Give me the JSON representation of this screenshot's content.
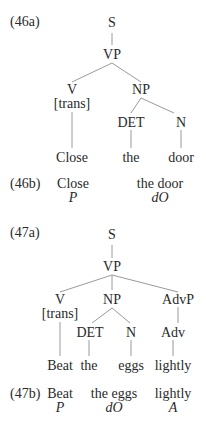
{
  "examples": [
    {
      "tree_label": "(46a)",
      "nodes": {
        "s": "S",
        "vp": "VP",
        "v": "V",
        "v_feature": "[trans]",
        "np": "NP",
        "det": "DET",
        "n": "N"
      },
      "leaves": {
        "verb": "Close",
        "det": "the",
        "noun": "door"
      },
      "gloss_label": "(46b)",
      "gloss": [
        {
          "text": "Close",
          "role": "P"
        },
        {
          "text": "the door",
          "role": "dO"
        }
      ]
    },
    {
      "tree_label": "(47a)",
      "nodes": {
        "s": "S",
        "vp": "VP",
        "v": "V",
        "v_feature": "[trans]",
        "np": "NP",
        "advp": "AdvP",
        "det": "DET",
        "n": "N",
        "adv": "Adv"
      },
      "leaves": {
        "verb": "Beat",
        "det": "the",
        "noun": "eggs",
        "adv": "lightly"
      },
      "gloss_label": "(47b)",
      "gloss": [
        {
          "text": "Beat",
          "role": "P"
        },
        {
          "text": "the eggs",
          "role": "dO"
        },
        {
          "text": "lightly",
          "role": "A"
        }
      ]
    }
  ]
}
